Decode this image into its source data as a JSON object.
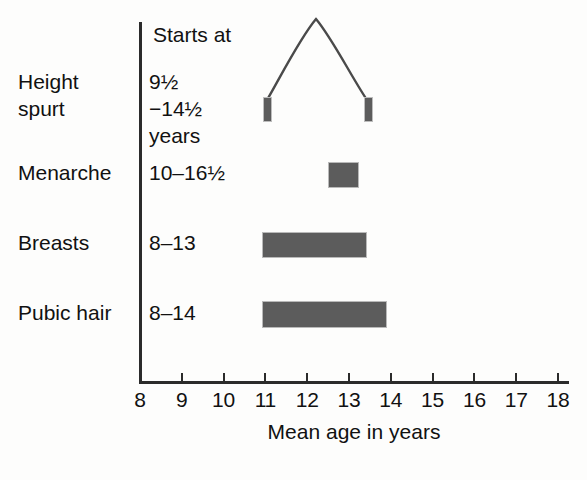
{
  "chart_data": {
    "type": "bar",
    "title": "",
    "xlabel": "Mean age in years",
    "ylabel": "",
    "xlim": [
      8,
      18
    ],
    "xticks": [
      "8",
      "9",
      "10",
      "11",
      "12",
      "13",
      "14",
      "15",
      "16",
      "17",
      "18"
    ],
    "grid": false,
    "legend": false,
    "column_header": "Starts at",
    "bar_color": "#5c5c5c",
    "axis_color": "#2b2b2b",
    "categories": [
      "Height spurt",
      "Menarche",
      "Breasts",
      "Pubic hair"
    ],
    "rows": [
      {
        "label": "Height\nspurt",
        "starts_at": "9½\n−14½\nyears",
        "mark": "curve-with-endpoints",
        "start": 11.0,
        "end": 13.4,
        "peak": 12.2
      },
      {
        "label": "Menarche",
        "starts_at": "10–16½",
        "mark": "bar",
        "start": 12.5,
        "end": 13.2
      },
      {
        "label": "Breasts",
        "starts_at": "8–13",
        "mark": "bar",
        "start": 11.0,
        "end": 13.4
      },
      {
        "label": "Pubic hair",
        "starts_at": "8–14",
        "mark": "bar",
        "start": 11.0,
        "end": 13.9
      }
    ]
  },
  "axis": {
    "title": "Mean age in years",
    "ticks": [
      "8",
      "9",
      "10",
      "11",
      "12",
      "13",
      "14",
      "15",
      "16",
      "17",
      "18"
    ]
  },
  "table": {
    "column_header": "Starts at",
    "row_labels": [
      "Height\nspurt",
      "Menarche",
      "Breasts",
      "Pubic hair"
    ],
    "starts_values": [
      "9½\n−14½\nyears",
      "10–16½",
      "8–13",
      "8–14"
    ]
  }
}
